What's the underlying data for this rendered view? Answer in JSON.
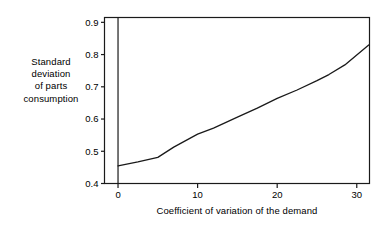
{
  "chart_data": {
    "type": "line",
    "title": "",
    "xlabel": "Coefficient of variation of the demand",
    "ylabel": "Standard deviation of parts consumption",
    "ylabel_lines": [
      "Standard",
      "deviation",
      "of parts",
      "consumption"
    ],
    "xlim": [
      -1.7,
      31.6
    ],
    "ylim": [
      0.4,
      0.915
    ],
    "xticks": [
      0,
      10,
      20,
      30
    ],
    "xtick_labels": [
      "0",
      "10",
      "20",
      "30"
    ],
    "yticks": [
      0.4,
      0.5,
      0.6,
      0.7,
      0.8,
      0.9
    ],
    "ytick_labels": [
      "0.4",
      "0.5",
      "0.6",
      "0.7",
      "0.8",
      "0.9"
    ],
    "grid": false,
    "legend": null,
    "series": [
      {
        "name": "standard deviation of parts consumption",
        "color": "#1a1a1a",
        "x": [
          0,
          2.5,
          5,
          7,
          10,
          12,
          15,
          17.5,
          20,
          22.5,
          25,
          26.5,
          28.5,
          31.5
        ],
        "y": [
          0.455,
          0.467,
          0.481,
          0.513,
          0.553,
          0.572,
          0.606,
          0.634,
          0.664,
          0.69,
          0.719,
          0.738,
          0.768,
          0.83
        ]
      }
    ],
    "axis_lines": {
      "frame": true,
      "zero_vertical_axis_at_x": 0
    }
  },
  "colors": {
    "background": "#ffffff",
    "axis": "#1a1a1a",
    "series": "#1a1a1a",
    "text": "#000000"
  }
}
